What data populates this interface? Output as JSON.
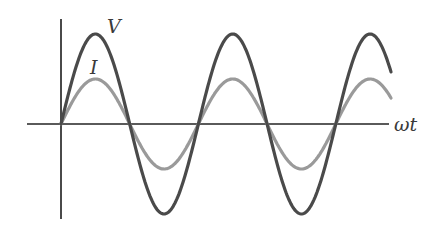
{
  "chart_data": {
    "type": "line",
    "title": "",
    "xlabel": "ωt",
    "ylabel": "",
    "grid": false,
    "legend": "inline labels",
    "series": [
      {
        "name": "V",
        "label": "V",
        "color": "#4a4a4a",
        "amplitude": 90,
        "description": "voltage sinusoid, larger amplitude, in phase with current"
      },
      {
        "name": "I",
        "label": "I",
        "color": "#9a9a9a",
        "amplitude": 45,
        "description": "current sinusoid, half the amplitude of V, in phase"
      }
    ],
    "phase_difference": 0,
    "cycles_shown": 2.65,
    "relation": "in phase"
  },
  "labels": {
    "voltage": "V",
    "current": "I",
    "x_axis": "ωt"
  },
  "colors": {
    "voltage": "#4a4a4a",
    "current": "#9a9a9a",
    "axes": "#555555"
  }
}
